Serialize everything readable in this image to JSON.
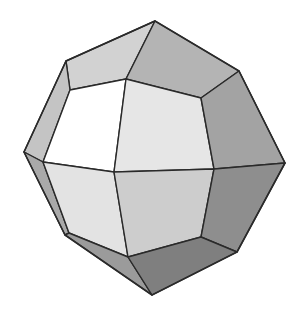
{
  "figure": {
    "colors": {
      "background": "#ffffff",
      "edge": "#2a2a2a",
      "face_white": "#ffffff",
      "face_lightest": "#ececec",
      "face_light": "#dedede",
      "face_mid_light": "#cfcfcf",
      "face_mid": "#b8b8b8",
      "face_mid_dark": "#a6a6a6",
      "face_dark": "#8f8f8f",
      "face_darkest": "#7d7d7d"
    },
    "faces": [
      {
        "name": "top-left-band",
        "fill": "#d2d2d2",
        "points": "66,61 155,21 126,79 70,90"
      },
      {
        "name": "top-right-face",
        "fill": "#b4b4b4",
        "points": "155,21 239,71 201,98 126,79"
      },
      {
        "name": "left-upper-band",
        "fill": "#c4c4c4",
        "points": "66,61 70,90 43,162 24,152"
      },
      {
        "name": "left-white-face",
        "fill": "#ffffff",
        "points": "70,90 126,79 114,172 43,162"
      },
      {
        "name": "center-upper-face",
        "fill": "#e6e6e6",
        "points": "126,79 201,98 214,169 114,172"
      },
      {
        "name": "right-upper-face",
        "fill": "#a3a3a3",
        "points": "239,71 285,163 214,169 201,98"
      },
      {
        "name": "left-lower-band",
        "fill": "#a9a9a9",
        "points": "24,152 43,162 69,233 65,235"
      },
      {
        "name": "left-lower-face",
        "fill": "#e3e3e3",
        "points": "43,162 114,172 128,257 69,233"
      },
      {
        "name": "center-lower-face",
        "fill": "#cdcdcd",
        "points": "114,172 214,169 201,237 128,257"
      },
      {
        "name": "right-lower-face",
        "fill": "#8e8e8e",
        "points": "214,169 285,163 237,252 201,237"
      },
      {
        "name": "bottom-left-band",
        "fill": "#9b9b9b",
        "points": "65,235 69,233 128,257 152,295"
      },
      {
        "name": "bottom-right-face",
        "fill": "#7f7f7f",
        "points": "128,257 201,237 237,252 152,295"
      }
    ],
    "outline": "155,21 239,71 285,163 237,252 152,295 65,235 24,152 66,61"
  }
}
